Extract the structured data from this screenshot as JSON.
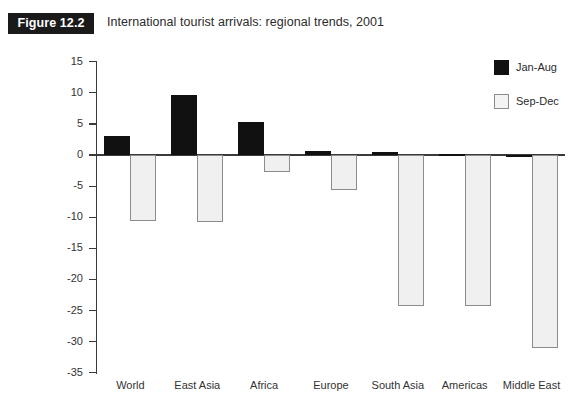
{
  "figure": {
    "badge": "Figure 12.2",
    "title": "International tourist arrivals: regional trends, 2001"
  },
  "legend": {
    "position": "top-right",
    "items": [
      {
        "label": "Jan-Aug",
        "color": "#111111",
        "swatch": "filled"
      },
      {
        "label": "Sep-Dec",
        "color": "#eff0ef",
        "swatch": "outlined"
      }
    ]
  },
  "axis": {
    "y_ticks": [
      "15",
      "10",
      "5",
      "0",
      "-5",
      "-10",
      "-15",
      "-20",
      "-25",
      "-30",
      "-35"
    ]
  },
  "chart_data": {
    "type": "bar",
    "title": "International tourist arrivals: regional trends, 2001",
    "xlabel": "",
    "ylabel": "",
    "ylim": [
      -35,
      15
    ],
    "ytick_step": 5,
    "grid": false,
    "legend_position": "top-right",
    "categories": [
      "World",
      "East Asia",
      "Africa",
      "Europe",
      "South Asia",
      "Americas",
      "Middle East"
    ],
    "series": [
      {
        "name": "Jan-Aug",
        "color": "#111111",
        "values": [
          3.0,
          9.7,
          5.3,
          0.7,
          0.5,
          0.1,
          0.0
        ]
      },
      {
        "name": "Sep-Dec",
        "color": "#eff0ef",
        "values": [
          -10.6,
          -10.7,
          -2.7,
          -5.6,
          -24.3,
          -24.3,
          -31.0
        ]
      }
    ]
  }
}
